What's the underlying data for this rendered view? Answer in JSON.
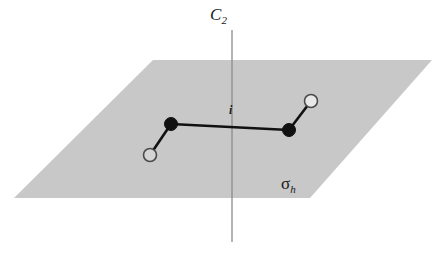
{
  "figure": {
    "kind": "symmetry-elements-diagram",
    "background_color": "#ffffff",
    "width": 441,
    "height": 254
  },
  "plane": {
    "name": "mirror-plane-sigma-h",
    "label": "σ",
    "label_subscript": "h",
    "fill_color": "#c8c8c8",
    "points": "153,60 432,60 310,198 14,198"
  },
  "axis": {
    "name": "c2-rotation-axis",
    "label": "C",
    "label_subscript": "2",
    "color": "#8a8a8a",
    "x": 232,
    "y_top": 30,
    "y_bottom": 242
  },
  "inversion_center": {
    "label": "i",
    "x": 232,
    "y": 127
  },
  "molecule": {
    "bond_color": "#111111",
    "filled_atom_color": "#111111",
    "open_atom_fill": "#d4d4d4",
    "open_atom_fill_light": "#e8e8e8",
    "open_atom_stroke": "#4a4a4a",
    "atoms": [
      {
        "id": "atom-open-lower-left",
        "type": "open",
        "cx": 150,
        "cy": 155,
        "r": 6.5
      },
      {
        "id": "atom-filled-left",
        "type": "filled",
        "cx": 171,
        "cy": 124,
        "r": 6.5
      },
      {
        "id": "atom-filled-right",
        "type": "filled",
        "cx": 289,
        "cy": 130,
        "r": 6.5
      },
      {
        "id": "atom-open-upper-right",
        "type": "open",
        "cx": 311,
        "cy": 101,
        "r": 6.5
      }
    ],
    "bonds": [
      {
        "id": "bond-open-left-to-filled-left",
        "x1": 150,
        "y1": 155,
        "x2": 171,
        "y2": 124
      },
      {
        "id": "bond-filled-left-to-filled-right",
        "x1": 171,
        "y1": 124,
        "x2": 289,
        "y2": 130
      },
      {
        "id": "bond-filled-right-to-open-right",
        "x1": 289,
        "y1": 130,
        "x2": 311,
        "y2": 101
      }
    ]
  }
}
